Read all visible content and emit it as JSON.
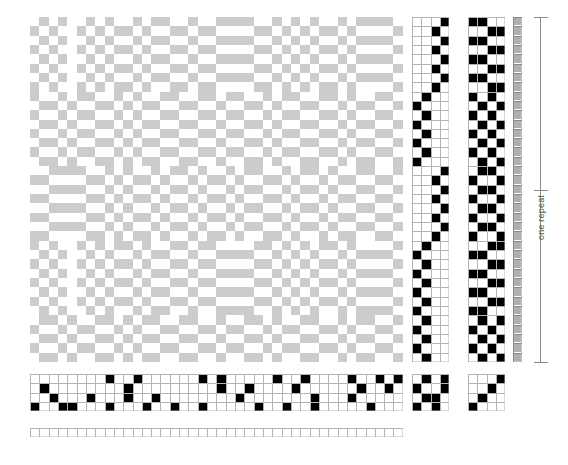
{
  "diagram": {
    "type": "4-shaft twill draft",
    "colors": {
      "ink": "#000000",
      "grid_line": "#b4b4b4",
      "cell_empty": "#ffffff",
      "cloth_weft": "#cccccc",
      "cloth_warp": "#ffffff",
      "ribbon_cell": "#b0b0b0",
      "bracket": "#8a8a8a",
      "label_text": "#555555"
    }
  },
  "annotations": {
    "repeat_label": "one repeat"
  },
  "layout": {
    "cell": 9.32,
    "drawdown": {
      "x": 30,
      "y": 17,
      "cols": 40,
      "rows": 37
    },
    "threading_right": {
      "x": 412,
      "y": 17,
      "cols": 4,
      "rows": 37
    },
    "treadling": {
      "x": 468,
      "y": 17,
      "cols": 4,
      "rows": 37
    },
    "repeat_ribbon": {
      "x": 513,
      "y": 17,
      "cols": 1,
      "rows": 37
    },
    "threading_bottom": {
      "x": 30,
      "y": 374,
      "cols": 40,
      "rows": 4
    },
    "tieup_left": {
      "x": 412,
      "y": 374,
      "cols": 4,
      "rows": 4
    },
    "tieup_right": {
      "x": 468,
      "y": 374,
      "cols": 4,
      "rows": 4
    },
    "warp_color_row": {
      "x": 30,
      "y": 428,
      "cols": 40,
      "rows": 1
    }
  },
  "draft_data": {
    "shafts": 4,
    "treadles": 4,
    "warp_ends": 40,
    "weft_picks": 37,
    "threading_bottom_rows": [
      "0000000010010000001010000010010000100101",
      "0100000000100000000010010000100000010010",
      "0010001000100100000000100000001000100000",
      "1001100010001001001000001001001000001000"
    ],
    "threading_right_rows": [
      "0001",
      "0010",
      "0001",
      "0010",
      "0001",
      "0010",
      "0001",
      "0010",
      "0100",
      "1000",
      "0100",
      "1000",
      "0100",
      "1000",
      "0100",
      "1000",
      "0001",
      "0010",
      "0001",
      "0010",
      "0001",
      "0010",
      "0001",
      "0010",
      "0100",
      "1000",
      "0100",
      "1000",
      "0100",
      "1000",
      "0100",
      "1000",
      "0100",
      "1000",
      "0100",
      "1000",
      "0100"
    ],
    "treadling_rows": [
      "1100",
      "0011",
      "1100",
      "0011",
      "1100",
      "0011",
      "1100",
      "0011",
      "1010",
      "0101",
      "1010",
      "0101",
      "1010",
      "0101",
      "1010",
      "0101",
      "0110",
      "1001",
      "0110",
      "1001",
      "0110",
      "1001",
      "0110",
      "1001",
      "0011",
      "1100",
      "0011",
      "1100",
      "0011",
      "1100",
      "0011",
      "1100",
      "0101",
      "1010",
      "0101",
      "1010",
      "0101"
    ],
    "tieup_left_rows": [
      "0101",
      "1001",
      "0110",
      "1010"
    ],
    "tieup_right_rows": [
      "0001",
      "0010",
      "0100",
      "1000"
    ],
    "repeat_ribbon_cells": 37,
    "warp_color_row": "0000000000000000000000000000000000000000",
    "drawdown_rows": [
      "0101001010010110010011110010101001011110",
      "1010010101101001101100001101010110100001",
      "0101001010010110010011110010101001011110",
      "1010010101101001101100001101010110100001",
      "0101001010010110010011110010101001011110",
      "1010010101101001101100001101010110100001",
      "0101001010010110010011110010101001011110",
      "1010010101101001101100001101010110100001",
      "1001011001010011001101100101100110100110",
      "0110100110101100110010011010011001011001",
      "1001011001010011001101100101100110100110",
      "0110100110101100110010011010011001011001",
      "1001011001010011001101100101100110100110",
      "0110100110101100110010011010011001011001",
      "1001011001010011001101100101100110100110",
      "0110100110101100110010011010011001011001",
      "0011110010100101101001011001011010011001",
      "1100001101011010010110100110100101100110",
      "0011110010100101101001011001011010011001",
      "1100001101011010010110100110100101100110",
      "0011110010100101101001011001011010011001",
      "1100001101011010010110100110100101100110",
      "0011110010100101101001011001011010011001",
      "1100001101011010010110100110100101100110",
      "1010010101101001101100001101010110100001",
      "0101001010010110010011110010101001011110",
      "1010010101101001101100001101010110100001",
      "0101001010010110010011110010101001011110",
      "1010010101101001101100001101010110100001",
      "0101001010010110010011110010101001011110",
      "1010010101101001101100001101010110100001",
      "0101001010010110010011110010101001011110",
      "0110100110101100110010011010011001011001",
      "1001011001010011001101100101100110100110",
      "0110100110101100110010011010011001011001",
      "1001011001010011001101100101100110100110",
      "0110100110101100110010011010011001011001"
    ]
  }
}
